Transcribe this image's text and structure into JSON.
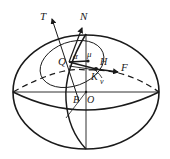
{
  "diagram": {
    "type": "ellipsoid-geometry",
    "colors": {
      "stroke": "#1a1a1a",
      "background": "#ffffff"
    },
    "labels": {
      "T": "T",
      "N": "N",
      "Q": "Q",
      "alpha": "α",
      "mu": "μ",
      "H": "H",
      "F": "F",
      "K": "K",
      "v": "v",
      "B": "B",
      "O": "O"
    },
    "vectors": [
      {
        "name": "T",
        "from": "B",
        "direction": "up-left"
      },
      {
        "name": "N",
        "from": "Q",
        "direction": "up"
      },
      {
        "name": "F",
        "from": "K",
        "direction": "right"
      }
    ],
    "points": [
      "Q",
      "H",
      "K",
      "B",
      "O"
    ]
  }
}
